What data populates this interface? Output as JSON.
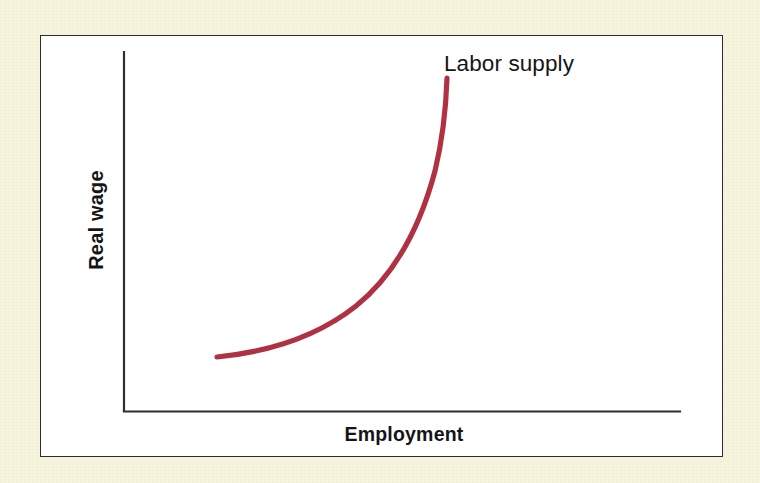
{
  "figure": {
    "background_color": "#f7f4de",
    "panel_color": "#ffffff",
    "panel_border_color": "#2b2b30",
    "axis_color": "#2f2f34"
  },
  "labels": {
    "y_axis": "Real wage",
    "x_axis": "Employment",
    "curve_annotation": "Labor supply"
  },
  "chart_data": {
    "type": "line",
    "title": "",
    "subtitle": "",
    "xlabel": "Employment",
    "ylabel": "Real wage",
    "xlim": [
      0,
      100
    ],
    "ylim": [
      0,
      100
    ],
    "grid": false,
    "axis_ticks": [],
    "xticklabels": [],
    "yticklabels": [],
    "legend": null,
    "legend_position": "none",
    "annotations": [
      {
        "text": "Labor supply",
        "x": 60,
        "y": 96,
        "color": "#151518",
        "bold": false,
        "font_size_px": 22.5
      }
    ],
    "series": [
      {
        "name": "Labor supply",
        "color": "#b03242",
        "line_width_px": 5.2,
        "style": "solid",
        "shape": "upward-sloping convex (backward-bending-free) supply curve, nearly vertical at high employment",
        "x": [
          16.7,
          22.0,
          27.0,
          32.0,
          37.0,
          41.0,
          44.5,
          47.5,
          50.0,
          52.5,
          54.5,
          56.0,
          57.3,
          58.0
        ],
        "y": [
          15.0,
          16.2,
          18.2,
          21.2,
          25.5,
          30.5,
          36.0,
          42.0,
          49.0,
          57.0,
          66.5,
          76.0,
          85.0,
          92.8
        ],
        "pixel_path": {
          "start": [
            217,
            357
          ],
          "control_1": [
            330,
            352
          ],
          "control_2": [
            430,
            300
          ],
          "mid": [
            400,
            240
          ],
          "end": [
            447,
            78
          ]
        }
      }
    ]
  },
  "geometry": {
    "canvas_width": 760,
    "canvas_height": 483,
    "panel": {
      "left": 40,
      "top": 35,
      "width": 683,
      "height": 422
    },
    "y_axis": {
      "x": 124,
      "y_top": 52,
      "y_bottom": 411
    },
    "x_axis": {
      "y": 411,
      "x_left": 124,
      "x_right": 680
    }
  }
}
